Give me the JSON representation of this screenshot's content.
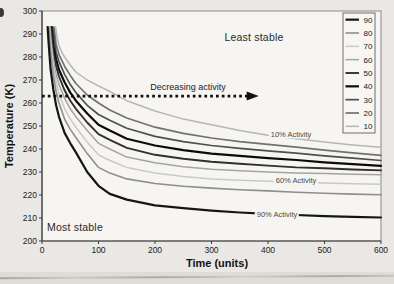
{
  "figure": {
    "background": "#e9e8e4",
    "plot_background": "#f6f5f1",
    "annotations": {
      "least_stable": "Least stable",
      "most_stable": "Most stable",
      "decreasing_activity": "Decreasing activity",
      "label_10": "10% Activity",
      "label_60": "60% Activity",
      "label_90": "90% Activity"
    }
  },
  "chart_data": {
    "type": "line",
    "title": "",
    "xlabel": "Time (units)",
    "ylabel": "Temperature (K)",
    "xlim": [
      0,
      600
    ],
    "ylim": [
      200,
      300
    ],
    "x_ticks": [
      0,
      100,
      200,
      300,
      400,
      500,
      600
    ],
    "y_ticks": [
      200,
      210,
      220,
      230,
      240,
      250,
      260,
      270,
      280,
      290,
      300
    ],
    "grid": false,
    "legend_position": "top-right",
    "legend_order": [
      "90",
      "80",
      "70",
      "60",
      "50",
      "40",
      "30",
      "20",
      "10"
    ],
    "arrow": {
      "temp": 263,
      "t_from": 0,
      "t_to": 380,
      "color": "#111111",
      "style": "dotted-arrow-right"
    },
    "curve_labels": [
      {
        "text": "10% Activity",
        "x": 291,
        "y": 133.5
      },
      {
        "text": "60% Activity",
        "x": 296,
        "y": 180
      },
      {
        "text": "90% Activity",
        "x": 277,
        "y": 214
      }
    ],
    "series": [
      {
        "name": "10",
        "color": "#b6b6b6",
        "width": 1.5,
        "points": [
          [
            24,
            293
          ],
          [
            27,
            288
          ],
          [
            30,
            285
          ],
          [
            35,
            282
          ],
          [
            40,
            280
          ],
          [
            50,
            276.5
          ],
          [
            60,
            273.5
          ],
          [
            80,
            270
          ],
          [
            100,
            267.5
          ],
          [
            120,
            265
          ],
          [
            150,
            261
          ],
          [
            200,
            256.5
          ],
          [
            250,
            253
          ],
          [
            300,
            250.5
          ],
          [
            350,
            248
          ],
          [
            400,
            246
          ],
          [
            450,
            244.5
          ],
          [
            500,
            243
          ],
          [
            550,
            241.8
          ],
          [
            600,
            240.8
          ]
        ]
      },
      {
        "name": "20",
        "color": "#717171",
        "width": 1.7,
        "points": [
          [
            21,
            293
          ],
          [
            25,
            285.5
          ],
          [
            30,
            281
          ],
          [
            40,
            276
          ],
          [
            50,
            272
          ],
          [
            60,
            268.5
          ],
          [
            80,
            263.5
          ],
          [
            100,
            260
          ],
          [
            120,
            257
          ],
          [
            150,
            253.5
          ],
          [
            200,
            249.5
          ],
          [
            250,
            246.8
          ],
          [
            300,
            244.8
          ],
          [
            350,
            243.2
          ],
          [
            400,
            242
          ],
          [
            450,
            240.8
          ],
          [
            500,
            239.5
          ],
          [
            550,
            238.3
          ],
          [
            600,
            237.2
          ]
        ]
      },
      {
        "name": "30",
        "color": "#4f4f4f",
        "width": 1.7,
        "points": [
          [
            19,
            293
          ],
          [
            22,
            287
          ],
          [
            25,
            282
          ],
          [
            30,
            278
          ],
          [
            40,
            272.5
          ],
          [
            50,
            268
          ],
          [
            60,
            264.5
          ],
          [
            80,
            259
          ],
          [
            100,
            255
          ],
          [
            120,
            252.5
          ],
          [
            150,
            249
          ],
          [
            200,
            245.5
          ],
          [
            250,
            243.2
          ],
          [
            300,
            241.5
          ],
          [
            350,
            240.3
          ],
          [
            400,
            239.2
          ],
          [
            450,
            238.2
          ],
          [
            500,
            237
          ],
          [
            550,
            236
          ],
          [
            600,
            235
          ]
        ]
      },
      {
        "name": "40",
        "color": "#0b0b0b",
        "width": 2.2,
        "points": [
          [
            17,
            293
          ],
          [
            20,
            285
          ],
          [
            25,
            279
          ],
          [
            30,
            274.5
          ],
          [
            40,
            269
          ],
          [
            50,
            264.5
          ],
          [
            60,
            261
          ],
          [
            80,
            255.5
          ],
          [
            100,
            250.5
          ],
          [
            120,
            248
          ],
          [
            150,
            244.5
          ],
          [
            200,
            241.5
          ],
          [
            250,
            239.5
          ],
          [
            300,
            238
          ],
          [
            350,
            237
          ],
          [
            400,
            236
          ],
          [
            450,
            235.2
          ],
          [
            500,
            234.2
          ],
          [
            550,
            233.4
          ],
          [
            600,
            232.7
          ]
        ]
      },
      {
        "name": "50",
        "color": "#303030",
        "width": 1.9,
        "points": [
          [
            16,
            293
          ],
          [
            20,
            282
          ],
          [
            25,
            276
          ],
          [
            30,
            271.5
          ],
          [
            40,
            265.5
          ],
          [
            50,
            261
          ],
          [
            60,
            257.5
          ],
          [
            80,
            251.5
          ],
          [
            100,
            246.5
          ],
          [
            120,
            244
          ],
          [
            150,
            240.5
          ],
          [
            200,
            237.5
          ],
          [
            250,
            235.8
          ],
          [
            300,
            234.5
          ],
          [
            350,
            233.6
          ],
          [
            400,
            232.8
          ],
          [
            450,
            232
          ],
          [
            500,
            231.6
          ],
          [
            550,
            231.1
          ],
          [
            600,
            230.7
          ]
        ]
      },
      {
        "name": "60",
        "color": "#a4a4a4",
        "width": 1.5,
        "points": [
          [
            14,
            293
          ],
          [
            17,
            285
          ],
          [
            20,
            279
          ],
          [
            25,
            272.5
          ],
          [
            30,
            268
          ],
          [
            40,
            262
          ],
          [
            50,
            257.5
          ],
          [
            60,
            254
          ],
          [
            80,
            248
          ],
          [
            100,
            242.5
          ],
          [
            120,
            240
          ],
          [
            150,
            236.5
          ],
          [
            200,
            234
          ],
          [
            250,
            232.3
          ],
          [
            300,
            231.2
          ],
          [
            350,
            230.5
          ],
          [
            400,
            230
          ],
          [
            450,
            229.6
          ],
          [
            500,
            229.3
          ],
          [
            550,
            229
          ],
          [
            600,
            228.8
          ]
        ]
      },
      {
        "name": "70",
        "color": "#c9c9c9",
        "width": 1.5,
        "points": [
          [
            13,
            293
          ],
          [
            16,
            285
          ],
          [
            20,
            276
          ],
          [
            25,
            269
          ],
          [
            30,
            264
          ],
          [
            40,
            257.5
          ],
          [
            50,
            253
          ],
          [
            60,
            249.5
          ],
          [
            80,
            243
          ],
          [
            100,
            237.5
          ],
          [
            120,
            235
          ],
          [
            150,
            232
          ],
          [
            200,
            229.5
          ],
          [
            250,
            228
          ],
          [
            300,
            227
          ],
          [
            350,
            226.4
          ],
          [
            400,
            226
          ],
          [
            450,
            225.6
          ],
          [
            500,
            225.2
          ],
          [
            550,
            224.9
          ],
          [
            600,
            224.7
          ]
        ]
      },
      {
        "name": "80",
        "color": "#8e8e8e",
        "width": 1.6,
        "points": [
          [
            12,
            293
          ],
          [
            15,
            283
          ],
          [
            20,
            272
          ],
          [
            25,
            265
          ],
          [
            30,
            260
          ],
          [
            40,
            253
          ],
          [
            50,
            248.5
          ],
          [
            60,
            245
          ],
          [
            80,
            238
          ],
          [
            100,
            232
          ],
          [
            120,
            229.5
          ],
          [
            150,
            227
          ],
          [
            200,
            225
          ],
          [
            250,
            223.8
          ],
          [
            300,
            223
          ],
          [
            350,
            222.3
          ],
          [
            400,
            221.8
          ],
          [
            450,
            221.2
          ],
          [
            500,
            220.8
          ],
          [
            550,
            220.4
          ],
          [
            600,
            220.1
          ]
        ]
      },
      {
        "name": "90",
        "color": "#151515",
        "width": 2.2,
        "points": [
          [
            10,
            293
          ],
          [
            12,
            285
          ],
          [
            15,
            275
          ],
          [
            20,
            266
          ],
          [
            25,
            259
          ],
          [
            30,
            254
          ],
          [
            40,
            247
          ],
          [
            50,
            242.5
          ],
          [
            60,
            238.5
          ],
          [
            80,
            230
          ],
          [
            100,
            224
          ],
          [
            120,
            220.5
          ],
          [
            150,
            218
          ],
          [
            200,
            215.5
          ],
          [
            250,
            214.3
          ],
          [
            300,
            213.2
          ],
          [
            350,
            212.4
          ],
          [
            400,
            211.8
          ],
          [
            450,
            211.3
          ],
          [
            500,
            210.8
          ],
          [
            550,
            210.5
          ],
          [
            600,
            210.2
          ]
        ]
      }
    ],
    "layout": {
      "plot_left": 42,
      "plot_top": 11,
      "plot_right": 381,
      "plot_bottom": 241,
      "axis_color": "#3c3c3c",
      "border_color": "#8a8a88",
      "tick_font_px": 8.5,
      "legend_font_px": 8,
      "legend_box": {
        "x": 343,
        "y": 13,
        "w": 32,
        "h": 120
      }
    }
  }
}
